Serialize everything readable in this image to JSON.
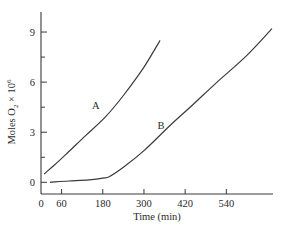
{
  "chart_data": {
    "type": "line",
    "title": "",
    "xlabel": "Time (min)",
    "ylabel": "Moles O2 × 10^6",
    "ylabel_parts": {
      "main": "Moles O",
      "sub": "2",
      "times": " × 10",
      "sup": "6"
    },
    "xlim": [
      0,
      676
    ],
    "ylim": [
      -0.7,
      10.2
    ],
    "xticks": [
      0,
      60,
      180,
      300,
      420,
      540
    ],
    "xtick_labels": [
      "0",
      "60",
      "180",
      "300",
      "420",
      "540"
    ],
    "yticks": [
      0,
      1.5,
      3,
      4.5,
      6,
      7.5,
      9
    ],
    "ytick_labels": [
      "0",
      "",
      "3",
      "",
      "6",
      "",
      "9"
    ],
    "grid": false,
    "legend": "none",
    "series": [
      {
        "name": "A",
        "label_at": {
          "x": 160,
          "y": 4.4
        },
        "points": [
          [
            9,
            0.5
          ],
          [
            40,
            1.05
          ],
          [
            79,
            1.8
          ],
          [
            130,
            2.8
          ],
          [
            187,
            3.9
          ],
          [
            240,
            5.2
          ],
          [
            300,
            6.9
          ],
          [
            347,
            8.5
          ]
        ]
      },
      {
        "name": "B",
        "label_at": {
          "x": 350,
          "y": 3.2
        },
        "points": [
          [
            26,
            0.0
          ],
          [
            80,
            0.08
          ],
          [
            140,
            0.15
          ],
          [
            180,
            0.25
          ],
          [
            200,
            0.35
          ],
          [
            240,
            0.9
          ],
          [
            300,
            1.9
          ],
          [
            376,
            3.4
          ],
          [
            440,
            4.6
          ],
          [
            513,
            6.0
          ],
          [
            600,
            7.6
          ],
          [
            673,
            9.2
          ]
        ]
      }
    ]
  }
}
